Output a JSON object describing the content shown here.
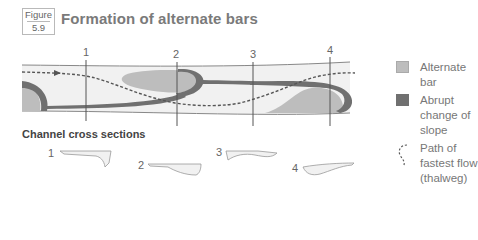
{
  "figure": {
    "label": "Figure",
    "number": "5.9",
    "title": "Formation of alternate bars"
  },
  "plan_view": {
    "section_markers": [
      "1",
      "2",
      "3",
      "4"
    ]
  },
  "legend": {
    "items": [
      {
        "label": "Alternate bar",
        "color": "#bdbdbd"
      },
      {
        "label": "Abrupt change of slope",
        "color": "#707070"
      },
      {
        "label": "Path of fastest flow (thalweg)",
        "style": "dashed"
      }
    ]
  },
  "cross_sections": {
    "title": "Channel cross sections",
    "labels": [
      "1",
      "2",
      "3",
      "4"
    ]
  },
  "colors": {
    "channel_fill": "#f1f1f1",
    "bar_fill": "#bdbdbd",
    "slope_fill": "#707070",
    "line": "#555555"
  }
}
